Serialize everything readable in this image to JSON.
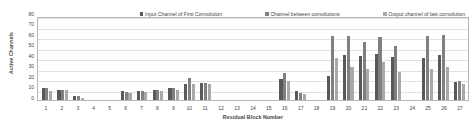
{
  "chart_data": {
    "type": "bar",
    "title": "",
    "xlabel": "Residual Block Number",
    "ylabel": "Active Channels",
    "ylim": [
      0,
      80
    ],
    "yticks": [
      0,
      10,
      20,
      30,
      40,
      50,
      60,
      70,
      80
    ],
    "grid": true,
    "legend_position": "top-center",
    "categories": [
      "1",
      "2",
      "3",
      "4",
      "5",
      "6",
      "7",
      "8",
      "9",
      "10",
      "11",
      "12",
      "13",
      "14",
      "15",
      "16",
      "17",
      "18",
      "19",
      "20",
      "21",
      "22",
      "23",
      "24",
      "25",
      "26",
      "27"
    ],
    "series": [
      {
        "name": "Input Channel of First Convolution",
        "color": "#595959",
        "values": [
          11,
          10,
          4,
          0,
          0,
          9,
          9,
          10,
          11,
          15,
          16,
          0,
          0,
          0,
          0,
          20,
          9,
          0,
          23,
          43,
          42,
          44,
          41,
          0,
          40,
          43,
          17
        ]
      },
      {
        "name": "Channel between convolutions",
        "color": "#808080",
        "values": [
          11,
          10,
          4,
          0,
          0,
          8,
          9,
          10,
          11,
          21,
          16,
          0,
          0,
          0,
          0,
          26,
          7,
          0,
          61,
          61,
          55,
          60,
          51,
          0,
          61,
          62,
          18
        ]
      },
      {
        "name": "Output channel of last convolution",
        "color": "#a9a9a9",
        "values": [
          9,
          10,
          2,
          0,
          0,
          7,
          8,
          9,
          10,
          15,
          15,
          0,
          0,
          0,
          0,
          18,
          6,
          0,
          40,
          31,
          30,
          36,
          27,
          0,
          30,
          31,
          15
        ]
      }
    ]
  },
  "legend": {
    "entries": [
      {
        "label": "Input Channel of First Convolution"
      },
      {
        "label": "Channel between convolutions"
      },
      {
        "label": "Output channel of last convolution"
      }
    ]
  },
  "axes": {
    "y_title": "Active Channels",
    "x_title": "Residual Block Number"
  }
}
